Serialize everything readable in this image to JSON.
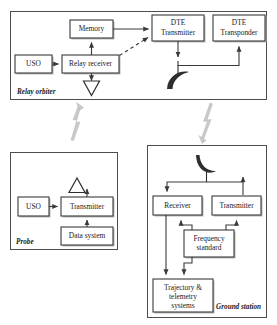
{
  "diagram": {
    "colors": {
      "background": "#ffffff",
      "panel_stroke": "#4d4d4d",
      "node_stroke": "#3a3a3a",
      "node_fill": "#ffffff",
      "node_shadow": "#b9b9b9",
      "link": "#3a3a3a",
      "antenna": "#2e2e2e",
      "rf_link": "#c9c9c9"
    },
    "panels": [
      {
        "id": "relay-orbiter",
        "label": "Relay orbiter"
      },
      {
        "id": "probe",
        "label": "Probe"
      },
      {
        "id": "ground-station",
        "label": "Ground station"
      }
    ],
    "nodes": {
      "relay_uso": {
        "label": "USO"
      },
      "relay_receiver": {
        "label": "Relay receiver"
      },
      "memory": {
        "label": "Memory"
      },
      "dte_transmitter": {
        "line1": "DTE",
        "line2": "Transmitter"
      },
      "dte_transponder": {
        "line1": "DTE",
        "line2": "Transponder"
      },
      "probe_uso": {
        "label": "USO"
      },
      "probe_transmitter": {
        "label": "Transmitter"
      },
      "data_system": {
        "label": "Data system"
      },
      "gs_receiver": {
        "label": "Receiver"
      },
      "gs_transmitter": {
        "label": "Transmitter"
      },
      "frequency_standard": {
        "line1": "Frequency",
        "line2": "standard"
      },
      "trajectory_telemetry": {
        "line1": "Trajectory &",
        "line2": "telemetry",
        "line3": "systems"
      }
    },
    "antennas": [
      {
        "id": "relay-orbiter-relay-antenna",
        "kind": "triangle-down"
      },
      {
        "id": "relay-orbiter-dte-dish",
        "kind": "dish-down"
      },
      {
        "id": "probe-antenna",
        "kind": "triangle-up"
      },
      {
        "id": "ground-station-dish",
        "kind": "dish-up"
      }
    ],
    "rf_links": [
      {
        "id": "probe-to-relay-orbiter",
        "direction": "up"
      },
      {
        "id": "relay-orbiter-to-ground-station",
        "direction": "down"
      }
    ],
    "connections": [
      {
        "from": "relay_uso",
        "to": "relay_receiver",
        "style": "solid"
      },
      {
        "from": "relay_receiver",
        "to": "memory",
        "style": "solid"
      },
      {
        "from": "relay_receiver",
        "to": "relay-orbiter-relay-antenna",
        "style": "solid"
      },
      {
        "from": "relay_receiver",
        "to": "dte_transmitter",
        "style": "dashed"
      },
      {
        "from": "memory",
        "to": "dte_transmitter",
        "style": "solid"
      },
      {
        "from": "dte_transmitter",
        "to": "relay-orbiter-dte-dish",
        "style": "solid"
      },
      {
        "from": "relay-orbiter-dte-dish",
        "to": "dte_transponder",
        "style": "solid"
      },
      {
        "from": "probe_uso",
        "to": "probe_transmitter",
        "style": "solid"
      },
      {
        "from": "data_system",
        "to": "probe_transmitter",
        "style": "solid"
      },
      {
        "from": "probe_transmitter",
        "to": "probe-antenna",
        "style": "solid"
      },
      {
        "from": "ground-station-dish",
        "to": "gs_receiver",
        "style": "solid"
      },
      {
        "from": "gs_transmitter",
        "to": "ground-station-dish",
        "style": "solid"
      },
      {
        "from": "frequency_standard",
        "to": "gs_receiver",
        "style": "solid"
      },
      {
        "from": "frequency_standard",
        "to": "gs_transmitter",
        "style": "solid"
      },
      {
        "from": "frequency_standard",
        "to": "trajectory_telemetry",
        "style": "solid"
      },
      {
        "from": "gs_receiver",
        "to": "trajectory_telemetry",
        "style": "solid"
      }
    ]
  }
}
